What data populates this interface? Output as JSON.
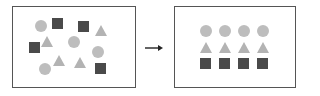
{
  "diagram": {
    "title": "",
    "colors": {
      "circle": "#bdbdbd",
      "triangle": "#b3b3b3",
      "square": "#4a4a4a",
      "border": "#555555"
    },
    "before_panel": {
      "label": "unsorted shapes",
      "shapes": [
        {
          "type": "circle",
          "x": 41,
          "y": 26
        },
        {
          "type": "square",
          "x": 58,
          "y": 24
        },
        {
          "type": "square",
          "x": 84,
          "y": 27
        },
        {
          "type": "triangle",
          "x": 101,
          "y": 31
        },
        {
          "type": "square",
          "x": 35,
          "y": 48
        },
        {
          "type": "triangle",
          "x": 47,
          "y": 42
        },
        {
          "type": "circle",
          "x": 74,
          "y": 42
        },
        {
          "type": "circle",
          "x": 98,
          "y": 52
        },
        {
          "type": "triangle",
          "x": 59,
          "y": 61
        },
        {
          "type": "triangle",
          "x": 80,
          "y": 63
        },
        {
          "type": "circle",
          "x": 45,
          "y": 69
        },
        {
          "type": "square",
          "x": 101,
          "y": 69
        }
      ]
    },
    "arrow": {
      "direction": "right"
    },
    "after_panel": {
      "label": "sorted shapes",
      "rows": [
        {
          "type": "circle",
          "count": 4
        },
        {
          "type": "triangle",
          "count": 4
        },
        {
          "type": "square",
          "count": 4
        }
      ]
    }
  }
}
